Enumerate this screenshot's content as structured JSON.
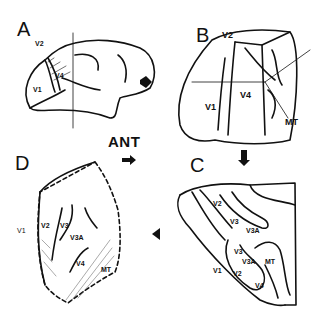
{
  "figure": {
    "panels": [
      {
        "id": "A",
        "letter": "A",
        "labels": [
          "V2",
          "V4",
          "V1"
        ]
      },
      {
        "id": "B",
        "letter": "B",
        "labels": [
          "V2",
          "V1",
          "V4",
          "MT"
        ]
      },
      {
        "id": "C",
        "letter": "C",
        "labels": [
          "V2",
          "V3",
          "V3A",
          "V3",
          "V3A",
          "MT",
          "V1",
          "V2",
          "V4"
        ]
      },
      {
        "id": "D",
        "letter": "D",
        "labels": [
          "V1",
          "V2",
          "V3",
          "V3A",
          "V4",
          "MT"
        ]
      }
    ],
    "orientation_label": "ANT",
    "arrows": [
      "A-to-B",
      "B-to-C",
      "C-to-D",
      "ANT-direction"
    ]
  }
}
